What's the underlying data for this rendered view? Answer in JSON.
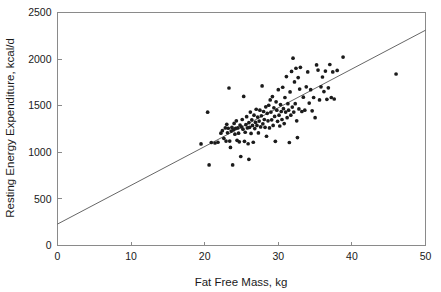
{
  "chart_data": {
    "type": "scatter",
    "title": "",
    "xlabel": "Fat Free Mass, kg",
    "ylabel": "Resting Energy Expenditure, kcal/d",
    "xlim": [
      0,
      50
    ],
    "ylim": [
      0,
      2500
    ],
    "xticks": [
      0,
      10,
      20,
      30,
      40,
      50
    ],
    "yticks": [
      0,
      500,
      1000,
      1500,
      2000,
      2500
    ],
    "xtick_labels": [
      "0",
      "10",
      "20",
      "30",
      "40",
      "50"
    ],
    "ytick_labels": [
      "0",
      "500",
      "1000",
      "1500",
      "2000",
      "2500"
    ],
    "grid": false,
    "legend": false,
    "legend_position": "none",
    "point_color": "#1b1b1b",
    "line_color": "#555555",
    "frame_color": "#8a8a8a",
    "background_color": "#ffffff",
    "regression_line": {
      "label": "least-squares fit",
      "x_start": 0,
      "y_start": 230,
      "x_end": 50,
      "y_end": 2310,
      "slope": 41.6,
      "intercept": 230
    },
    "series": [
      {
        "name": "Subjects",
        "marker": "filled-circle",
        "points": [
          [
            19.5,
            1090
          ],
          [
            20.4,
            1430
          ],
          [
            20.6,
            865
          ],
          [
            20.9,
            1105
          ],
          [
            21.4,
            1100
          ],
          [
            21.8,
            1108
          ],
          [
            22.2,
            1205
          ],
          [
            22.4,
            1232
          ],
          [
            22.6,
            1150
          ],
          [
            22.8,
            1262
          ],
          [
            22.9,
            1120
          ],
          [
            23.0,
            1300
          ],
          [
            23.1,
            1210
          ],
          [
            23.2,
            1258
          ],
          [
            23.3,
            1690
          ],
          [
            23.4,
            1120
          ],
          [
            23.5,
            1052
          ],
          [
            23.6,
            1228
          ],
          [
            23.7,
            1268
          ],
          [
            23.8,
            865
          ],
          [
            23.9,
            1242
          ],
          [
            24.0,
            1310
          ],
          [
            24.1,
            1195
          ],
          [
            24.2,
            1258
          ],
          [
            24.3,
            1338
          ],
          [
            24.4,
            1128
          ],
          [
            24.5,
            1262
          ],
          [
            24.6,
            1205
          ],
          [
            24.7,
            1112
          ],
          [
            24.8,
            1292
          ],
          [
            24.9,
            955
          ],
          [
            25.0,
            1272
          ],
          [
            25.1,
            1352
          ],
          [
            25.2,
            1248
          ],
          [
            25.3,
            1600
          ],
          [
            25.4,
            1118
          ],
          [
            25.5,
            1215
          ],
          [
            25.6,
            1298
          ],
          [
            25.7,
            1382
          ],
          [
            25.8,
            1262
          ],
          [
            25.9,
            1092
          ],
          [
            26.0,
            1318
          ],
          [
            26.0,
            925
          ],
          [
            26.1,
            1268
          ],
          [
            26.2,
            1432
          ],
          [
            26.3,
            1202
          ],
          [
            26.4,
            1348
          ],
          [
            26.5,
            1288
          ],
          [
            26.6,
            1108
          ],
          [
            26.7,
            1398
          ],
          [
            26.8,
            1255
          ],
          [
            26.9,
            1322
          ],
          [
            27.0,
            1462
          ],
          [
            27.1,
            1288
          ],
          [
            27.2,
            1378
          ],
          [
            27.3,
            1208
          ],
          [
            27.4,
            1335
          ],
          [
            27.5,
            1452
          ],
          [
            27.6,
            1272
          ],
          [
            27.7,
            1392
          ],
          [
            27.8,
            1712
          ],
          [
            27.9,
            1305
          ],
          [
            28.0,
            1438
          ],
          [
            28.1,
            1352
          ],
          [
            28.2,
            1268
          ],
          [
            28.3,
            1488
          ],
          [
            28.4,
            1172
          ],
          [
            28.5,
            1418
          ],
          [
            28.6,
            1338
          ],
          [
            28.7,
            1505
          ],
          [
            28.8,
            1262
          ],
          [
            28.9,
            1562
          ],
          [
            29.0,
            1432
          ],
          [
            29.1,
            1348
          ],
          [
            29.2,
            1598
          ],
          [
            29.3,
            1288
          ],
          [
            29.4,
            1478
          ],
          [
            29.5,
            1385
          ],
          [
            29.6,
            1118
          ],
          [
            29.7,
            1542
          ],
          [
            29.8,
            1452
          ],
          [
            29.9,
            1332
          ],
          [
            30.0,
            1672
          ],
          [
            30.1,
            1398
          ],
          [
            30.2,
            1282
          ],
          [
            30.3,
            1512
          ],
          [
            30.4,
            1438
          ],
          [
            30.5,
            1352
          ],
          [
            30.6,
            1698
          ],
          [
            30.7,
            1468
          ],
          [
            30.8,
            1308
          ],
          [
            30.9,
            1588
          ],
          [
            31.0,
            1432
          ],
          [
            31.1,
            1812
          ],
          [
            31.2,
            1372
          ],
          [
            31.3,
            1522
          ],
          [
            31.4,
            1452
          ],
          [
            31.5,
            1105
          ],
          [
            31.6,
            1648
          ],
          [
            31.7,
            1398
          ],
          [
            31.8,
            1868
          ],
          [
            31.9,
            1485
          ],
          [
            32.0,
            2010
          ],
          [
            32.1,
            1432
          ],
          [
            32.2,
            1755
          ],
          [
            32.3,
            1522
          ],
          [
            32.4,
            1902
          ],
          [
            32.5,
            1338
          ],
          [
            32.6,
            1158
          ],
          [
            32.7,
            1802
          ],
          [
            32.8,
            1465
          ],
          [
            32.9,
            1678
          ],
          [
            33.0,
            1912
          ],
          [
            33.2,
            1438
          ],
          [
            33.4,
            1592
          ],
          [
            33.6,
            1452
          ],
          [
            33.8,
            1702
          ],
          [
            34.0,
            1862
          ],
          [
            34.2,
            1528
          ],
          [
            34.4,
            1672
          ],
          [
            34.6,
            1445
          ],
          [
            34.8,
            1588
          ],
          [
            35.0,
            1372
          ],
          [
            35.2,
            1938
          ],
          [
            35.4,
            1882
          ],
          [
            35.6,
            1562
          ],
          [
            35.8,
            1702
          ],
          [
            36.0,
            1808
          ],
          [
            36.2,
            1652
          ],
          [
            36.4,
            1872
          ],
          [
            36.6,
            1568
          ],
          [
            36.8,
            1692
          ],
          [
            37.0,
            1942
          ],
          [
            37.2,
            1588
          ],
          [
            37.4,
            1862
          ],
          [
            37.6,
            1572
          ],
          [
            38.0,
            1878
          ],
          [
            38.8,
            2022
          ],
          [
            46.0,
            1840
          ]
        ]
      }
    ]
  }
}
